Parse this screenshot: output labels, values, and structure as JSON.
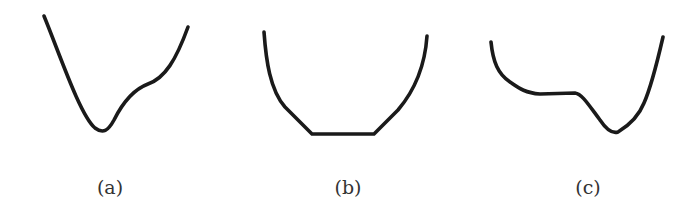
{
  "figure": {
    "stroke_color": "#1a1a1a",
    "background": "#ffffff",
    "panels": [
      {
        "id": "a",
        "label": "(a)",
        "label_x": 110,
        "description": "asymmetric well: steep left wall descending to a single minimum, right side rises with a shoulder/inflection",
        "path": "M 44 16 C 60 55, 80 115, 95 128 C 103 134, 108 131, 114 120 C 122 104, 132 90, 148 84 C 165 78, 176 60, 188 27"
      },
      {
        "id": "b",
        "label": "(b)",
        "label_x": 348,
        "description": "symmetric bowl with a flat bottom segment",
        "path": "M 264 32 C 266 60, 270 90, 285 107 L 312 134 L 374 134 L 398 110 C 415 90, 425 65, 427 36"
      },
      {
        "id": "c",
        "label": "(c)",
        "label_x": 588,
        "description": "well with a flat plateau on the left and a single sharp minimum on the right",
        "path": "M 491 42 C 493 62, 498 74, 510 82 C 520 89, 526 93, 540 94 L 575 93 C 582 94, 588 104, 600 120 C 606 129, 612 134, 618 132 C 628 126, 638 118, 644 103 C 652 85, 660 50, 663 37"
      }
    ]
  }
}
